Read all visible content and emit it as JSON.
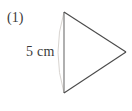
{
  "figure": {
    "item_number": "(1)",
    "side_length_label": "5 cm",
    "background_color": "#ffffff",
    "stroke_color": "#4a4a4a",
    "base_stroke_color": "#6e6e6e",
    "arc_color": "#d8d4d0",
    "text_color": "#3a3a3a",
    "shape": "triangle",
    "triangle": {
      "vertices": [
        {
          "name": "top",
          "x": 64,
          "y": 12
        },
        {
          "name": "right",
          "x": 126,
          "y": 52
        },
        {
          "name": "bottom",
          "x": 64,
          "y": 93
        }
      ],
      "base": {
        "name": "left-vertical-base",
        "x1": 64,
        "y1": 12,
        "x2": 64,
        "y2": 93,
        "length_label": "5 cm"
      }
    },
    "construction_arc": {
      "name": "compass-arc",
      "start_x": 64,
      "start_y": 12,
      "end_x": 64,
      "end_y": 93,
      "bulge_x": 54,
      "bulge_y": 52
    }
  }
}
